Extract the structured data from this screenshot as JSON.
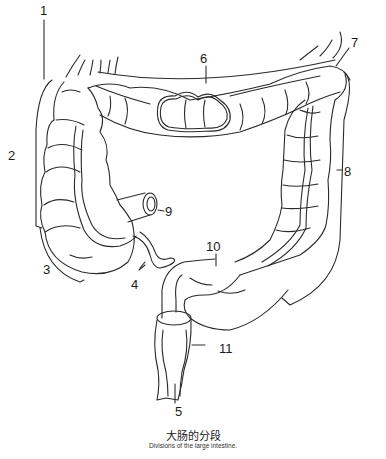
{
  "figure": {
    "title_cn": "大肠的分段",
    "title_en": "Divisions of the large intestine.",
    "stroke_color": "#2a2a2a",
    "background": "#ffffff"
  },
  "labels": [
    {
      "id": "1",
      "text": "1",
      "x": 40,
      "y": 4
    },
    {
      "id": "2",
      "text": "2",
      "x": 8,
      "y": 149
    },
    {
      "id": "3",
      "text": "3",
      "x": 43,
      "y": 263
    },
    {
      "id": "4",
      "text": "4",
      "x": 131,
      "y": 278
    },
    {
      "id": "5",
      "text": "5",
      "x": 175,
      "y": 405
    },
    {
      "id": "6",
      "text": "6",
      "x": 200,
      "y": 52
    },
    {
      "id": "7",
      "text": "7",
      "x": 351,
      "y": 36
    },
    {
      "id": "8",
      "text": "8",
      "x": 344,
      "y": 165
    },
    {
      "id": "9",
      "text": "9",
      "x": 165,
      "y": 205
    },
    {
      "id": "10",
      "text": "10",
      "x": 206,
      "y": 240
    },
    {
      "id": "11",
      "text": "11",
      "x": 219,
      "y": 342
    }
  ]
}
